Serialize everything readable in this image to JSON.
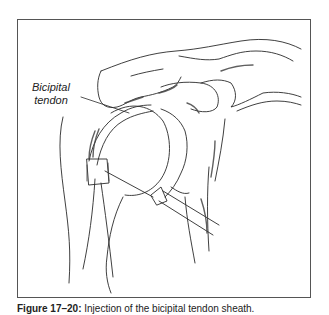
{
  "figure": {
    "label": {
      "line1": "Bicipital",
      "line2": "tendon"
    },
    "caption": {
      "number": "Figure 17–20:",
      "text": " Injection of the bicipital tendon sheath."
    },
    "colors": {
      "line": "#2a2a2a",
      "shade": "#444444",
      "frame": "#555555",
      "background": "#ffffff"
    }
  }
}
